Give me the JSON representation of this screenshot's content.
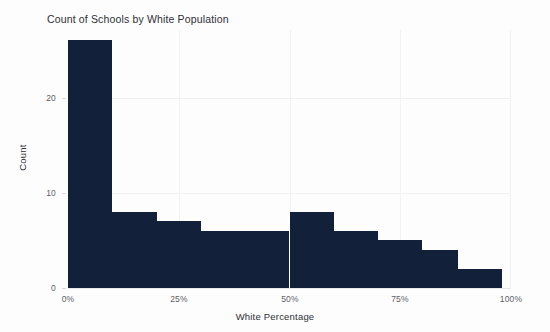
{
  "chart_data": {
    "type": "bar",
    "title": "Count of Schools by White Population",
    "xlabel": "White Percentage",
    "ylabel": "Count",
    "xlim": [
      0,
      100
    ],
    "ylim": [
      0,
      27
    ],
    "grid": true,
    "legend": null,
    "bar_color": "#12203a",
    "background_color": "#ffffff",
    "bin_width": 10,
    "categories": [
      "0-10%",
      "10-20%",
      "20-30%",
      "30-40%",
      "40-50%",
      "50-60%",
      "60-70%",
      "70-80%",
      "80-90%",
      "90-100%"
    ],
    "bin_starts": [
      0,
      10,
      20,
      30,
      40,
      50,
      60,
      70,
      80,
      88
    ],
    "bin_ends": [
      10,
      20,
      30,
      40,
      50,
      60,
      70,
      80,
      88,
      88
    ],
    "values": [
      26,
      8,
      7,
      6,
      6,
      8,
      6,
      5,
      4,
      2
    ],
    "xticks": [
      "0%",
      "25%",
      "50%",
      "75%",
      "100%"
    ],
    "xtick_values": [
      0,
      25,
      50,
      75,
      100
    ],
    "yticks": [
      "0",
      "10",
      "20"
    ],
    "ytick_values": [
      0,
      10,
      20
    ]
  }
}
